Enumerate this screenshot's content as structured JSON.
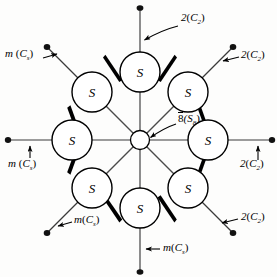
{
  "figure": {
    "center_atom_label": "",
    "atom_label": "S",
    "center_label": {
      "overlined": "8",
      "paren": "(S",
      "sub": "8",
      "close": ")"
    },
    "colors": {
      "ink": "#000000",
      "background": "#fdfdfc",
      "bond": "#000000",
      "spoke": "#4a4a4a"
    },
    "geometry": {
      "center_x": 140,
      "center_y": 140,
      "ring_radius": 68,
      "atom_radius": 20,
      "hub_radius": 9,
      "axis_length": 133
    }
  },
  "atoms": [
    {
      "id": "s-top",
      "label": "S",
      "angle_deg": 90
    },
    {
      "id": "s-upper-right",
      "label": "S",
      "angle_deg": 45
    },
    {
      "id": "s-right",
      "label": "S",
      "angle_deg": 0
    },
    {
      "id": "s-lower-right",
      "label": "S",
      "angle_deg": -45
    },
    {
      "id": "s-bottom",
      "label": "S",
      "angle_deg": -90
    },
    {
      "id": "s-lower-left",
      "label": "S",
      "angle_deg": -135
    },
    {
      "id": "s-left",
      "label": "S",
      "angle_deg": 180
    },
    {
      "id": "s-upper-left",
      "label": "S",
      "angle_deg": 135
    }
  ],
  "symmetry_labels": [
    {
      "id": "label-top",
      "kind": "rotation",
      "text": "2",
      "paren_open": "(",
      "italic": "C",
      "sub": "2",
      "paren_close": ")"
    },
    {
      "id": "label-upper-right",
      "kind": "rotation",
      "text": "2",
      "paren_open": "(",
      "italic": "C",
      "sub": "2",
      "paren_close": ")"
    },
    {
      "id": "label-right",
      "kind": "rotation",
      "text": "2",
      "paren_open": "(",
      "italic": "C",
      "sub": "2",
      "paren_close": ")"
    },
    {
      "id": "label-lower-right",
      "kind": "rotation",
      "text": "2",
      "paren_open": "(",
      "italic": "C",
      "sub": "2",
      "paren_close": ")"
    },
    {
      "id": "label-bottom",
      "kind": "mirror",
      "text": "m",
      "paren_open": "(",
      "italic": "C",
      "sub": "s",
      "paren_close": ")"
    },
    {
      "id": "label-lower-left",
      "kind": "mirror",
      "text": "m",
      "paren_open": "(",
      "italic": "C",
      "sub": "s",
      "paren_close": ")"
    },
    {
      "id": "label-left",
      "kind": "mirror",
      "text": "m",
      "paren_open": "(",
      "italic": "C",
      "sub": "s",
      "paren_close": ")"
    },
    {
      "id": "label-upper-left",
      "kind": "mirror",
      "text": "m",
      "paren_open": "(",
      "italic": "C",
      "sub": "s",
      "paren_close": ")"
    }
  ],
  "text": {
    "rot_num": "2",
    "mirror_m": "m",
    "paren_open": "(",
    "paren_close": ")",
    "c_italic": "C",
    "sub_two": "2",
    "sub_s": "s",
    "atom": "S",
    "eight": "8",
    "s_cap": "S",
    "sub_eight": "8"
  }
}
